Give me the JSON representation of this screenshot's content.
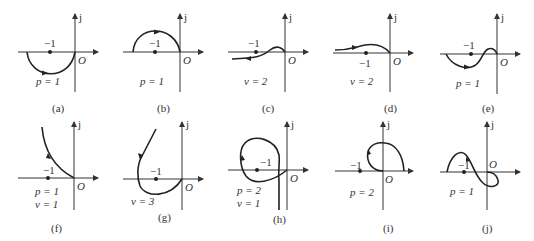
{
  "figure": {
    "panels": [
      {
        "id": "a",
        "caption": "(a)",
        "minus_one": "−1",
        "axis_j": "j",
        "origin": "O",
        "params": [
          "p = 1"
        ]
      },
      {
        "id": "b",
        "caption": "(b)",
        "minus_one": "−1",
        "axis_j": "j",
        "origin": "O",
        "params": [
          "p = 1"
        ]
      },
      {
        "id": "c",
        "caption": "(c)",
        "minus_one": "−1",
        "axis_j": "j",
        "origin": "O",
        "params": [
          "v = 2"
        ]
      },
      {
        "id": "d",
        "caption": "(d)",
        "minus_one": "−1",
        "axis_j": "j",
        "origin": "O",
        "params": [
          "v = 2"
        ]
      },
      {
        "id": "e",
        "caption": "(e)",
        "minus_one": "−1",
        "axis_j": "j",
        "origin": "O",
        "params": [
          "p = 1"
        ]
      },
      {
        "id": "f",
        "caption": "(f)",
        "minus_one": "−1",
        "axis_j": "j",
        "origin": "O",
        "params": [
          "p = 1",
          "v = 1"
        ]
      },
      {
        "id": "g",
        "caption": "(g)",
        "minus_one": "−1",
        "axis_j": "j",
        "origin": "O",
        "params": [
          "v = 3"
        ]
      },
      {
        "id": "h",
        "caption": "(h)",
        "minus_one": "−1",
        "axis_j": "j",
        "origin": "O",
        "params": [
          "p = 2",
          "v = 1"
        ]
      },
      {
        "id": "i",
        "caption": "(i)",
        "minus_one": "−1",
        "axis_j": "j",
        "origin": "O",
        "params": [
          "p = 2"
        ]
      },
      {
        "id": "j",
        "caption": "(j)",
        "minus_one": "−1",
        "axis_j": "j",
        "origin": "O",
        "params": [
          "p = 1"
        ]
      }
    ]
  }
}
